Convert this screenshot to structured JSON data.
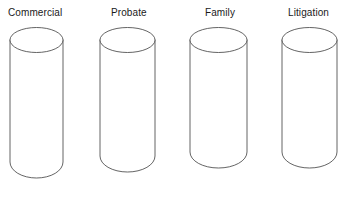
{
  "figure": {
    "type": "cylinder-diagram",
    "background_color": "#ffffff",
    "stroke_color": "#3c3c3c",
    "label_color": "#1a1a1a",
    "cylinders": [
      {
        "label": "Commercial",
        "label_x": 8,
        "label_y": 7,
        "cx": 36.5,
        "left": 10,
        "right": 63,
        "rx": 26.5,
        "ry": 12.5,
        "top_y": 40,
        "bottom_y": 178,
        "bottom_ry": 16
      },
      {
        "label": "Probate",
        "label_x": 111,
        "label_y": 7,
        "cx": 127.5,
        "left": 100,
        "right": 155,
        "rx": 27.5,
        "ry": 12.5,
        "top_y": 40,
        "bottom_y": 172,
        "bottom_ry": 16
      },
      {
        "label": "Family",
        "label_x": 205,
        "label_y": 7,
        "cx": 218.5,
        "left": 190,
        "right": 247,
        "rx": 28.5,
        "ry": 12.5,
        "top_y": 40,
        "bottom_y": 168,
        "bottom_ry": 16
      },
      {
        "label": "Litigation",
        "label_x": 288,
        "label_y": 7,
        "cx": 309.5,
        "left": 282,
        "right": 337,
        "rx": 27.5,
        "ry": 12.5,
        "top_y": 40,
        "bottom_y": 168,
        "bottom_ry": 16
      }
    ]
  }
}
